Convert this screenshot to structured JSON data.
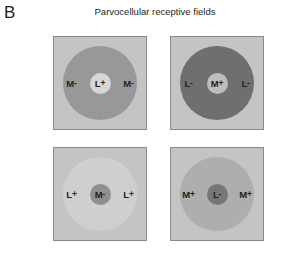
{
  "figure": {
    "panel_letter": "B",
    "title": "Parvocellular receptive fields",
    "background_color": "#ffffff",
    "text_color": "#231f20",
    "border_color": "#8a8a8a"
  },
  "chart_data": {
    "type": "diagram",
    "title": "Parvocellular receptive fields",
    "panel": "B",
    "layout": {
      "rows": 2,
      "columns": 2,
      "cell_size_px": 94,
      "surround_diameter_px": 74,
      "center_diameter_px": 21
    },
    "cells": [
      {
        "position": "top-left",
        "square_color": "#c4c4c4",
        "surround_color": "#989898",
        "center_color": "#d7d7d7",
        "center_label": "L",
        "center_sign": "+",
        "surround_label": "M",
        "surround_sign": "-",
        "label_left": "M-",
        "label_center": "L+",
        "label_right": "M-"
      },
      {
        "position": "top-right",
        "square_color": "#c4c4c4",
        "surround_color": "#6f6f6f",
        "center_color": "#bdbdbd",
        "center_label": "M",
        "center_sign": "+",
        "surround_label": "L",
        "surround_sign": "-",
        "label_left": "L-",
        "label_center": "M+",
        "label_right": "L-"
      },
      {
        "position": "bottom-left",
        "square_color": "#c4c4c4",
        "surround_color": "#cfcfcf",
        "center_color": "#8f8f8f",
        "center_label": "M",
        "center_sign": "-",
        "surround_label": "L",
        "surround_sign": "+",
        "label_left": "L+",
        "label_center": "M-",
        "label_right": "L+"
      },
      {
        "position": "bottom-right",
        "square_color": "#c4c4c4",
        "surround_color": "#aeaeae",
        "center_color": "#777777",
        "center_label": "L",
        "center_sign": "-",
        "surround_label": "M",
        "surround_sign": "+",
        "label_left": "M+",
        "label_center": "L-",
        "label_right": "M+"
      }
    ]
  }
}
